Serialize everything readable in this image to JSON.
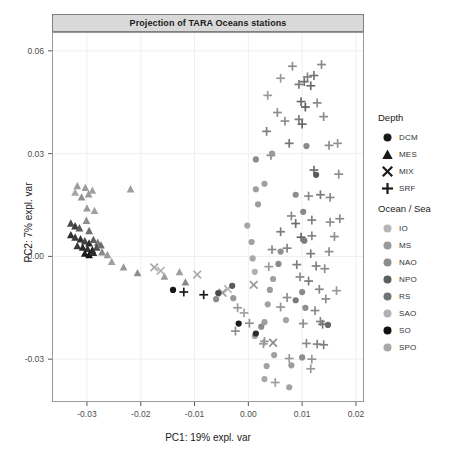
{
  "chart_data": {
    "type": "scatter",
    "title": "Projection of TARA Oceans stations",
    "xlabel": "PC1: 19% expl. var",
    "ylabel": "PC2: 7% expl. var",
    "xlim": [
      -0.0365,
      0.0215
    ],
    "ylim": [
      -0.0425,
      0.0655
    ],
    "xticks": [
      -0.03,
      -0.02,
      -0.01,
      0.0,
      0.01,
      0.02
    ],
    "xtick_labels": [
      "-0.03",
      "-0.02",
      "-0.01",
      "0.00",
      "0.01",
      "0.02"
    ],
    "yticks": [
      -0.03,
      0.0,
      0.03,
      0.06
    ],
    "ytick_labels": [
      "-0.03",
      "0.00",
      "0.03",
      "0.06"
    ],
    "grid": true,
    "grid_color": "#efefef",
    "panel_title_bg": "#d9d9d9",
    "legends": [
      {
        "title": "Depth",
        "name": "depth",
        "entries": [
          {
            "label": "DCM",
            "shape": "circle"
          },
          {
            "label": "MES",
            "shape": "triangle"
          },
          {
            "label": "MIX",
            "shape": "cross-x"
          },
          {
            "label": "SRF",
            "shape": "plus"
          }
        ]
      },
      {
        "title": "Ocean / Sea",
        "name": "ocean-sea",
        "entries": [
          {
            "label": "IO",
            "color": "#b6b6b6"
          },
          {
            "label": "MS",
            "color": "#9a9a9a"
          },
          {
            "label": "NAO",
            "color": "#8d8d8d"
          },
          {
            "label": "NPO",
            "color": "#5e5e5e"
          },
          {
            "label": "RS",
            "color": "#737373"
          },
          {
            "label": "SAO",
            "color": "#b0b0b0"
          },
          {
            "label": "SO",
            "color": "#111111"
          },
          {
            "label": "SPO",
            "color": "#a8a8a8"
          }
        ]
      }
    ],
    "points": [
      {
        "x": -0.0318,
        "y": 0.0205,
        "shape": "triangle",
        "color": "#9c9c9c"
      },
      {
        "x": -0.0303,
        "y": 0.02,
        "shape": "triangle",
        "color": "#9c9c9c"
      },
      {
        "x": -0.029,
        "y": 0.0192,
        "shape": "triangle",
        "color": "#a2a2a2"
      },
      {
        "x": -0.0322,
        "y": 0.0186,
        "shape": "triangle",
        "color": "#a5a5a5"
      },
      {
        "x": -0.0297,
        "y": 0.0181,
        "shape": "triangle",
        "color": "#9a9a9a"
      },
      {
        "x": -0.031,
        "y": 0.0172,
        "shape": "triangle",
        "color": "#8f8f8f"
      },
      {
        "x": -0.0219,
        "y": 0.0196,
        "shape": "triangle",
        "color": "#9f9f9f"
      },
      {
        "x": -0.03,
        "y": 0.014,
        "shape": "triangle",
        "color": "#9a9a9a"
      },
      {
        "x": -0.0286,
        "y": 0.0133,
        "shape": "triangle",
        "color": "#a0a0a0"
      },
      {
        "x": -0.033,
        "y": 0.0096,
        "shape": "triangle",
        "color": "#4a4a4a"
      },
      {
        "x": -0.0322,
        "y": 0.0088,
        "shape": "triangle",
        "color": "#3c3c3c"
      },
      {
        "x": -0.0314,
        "y": 0.0082,
        "shape": "triangle",
        "color": "#565656"
      },
      {
        "x": -0.0301,
        "y": 0.0104,
        "shape": "triangle",
        "color": "#8e8e8e"
      },
      {
        "x": -0.0296,
        "y": 0.0074,
        "shape": "triangle",
        "color": "#6c6c6c"
      },
      {
        "x": -0.033,
        "y": 0.0062,
        "shape": "triangle",
        "color": "#2f2f2f"
      },
      {
        "x": -0.0322,
        "y": 0.0055,
        "shape": "triangle",
        "color": "#3a3a3a"
      },
      {
        "x": -0.0312,
        "y": 0.005,
        "shape": "triangle",
        "color": "#303030"
      },
      {
        "x": -0.0304,
        "y": 0.0044,
        "shape": "triangle",
        "color": "#444444"
      },
      {
        "x": -0.0296,
        "y": 0.0038,
        "shape": "triangle",
        "color": "#2b2b2b"
      },
      {
        "x": -0.0288,
        "y": 0.0048,
        "shape": "triangle",
        "color": "#5f5f5f"
      },
      {
        "x": -0.028,
        "y": 0.004,
        "shape": "triangle",
        "color": "#7a7a7a"
      },
      {
        "x": -0.0318,
        "y": 0.003,
        "shape": "triangle",
        "color": "#383838"
      },
      {
        "x": -0.0308,
        "y": 0.0026,
        "shape": "triangle",
        "color": "#2a2a2a"
      },
      {
        "x": -0.0299,
        "y": 0.0022,
        "shape": "triangle",
        "color": "#333333"
      },
      {
        "x": -0.029,
        "y": 0.0018,
        "shape": "triangle",
        "color": "#202020"
      },
      {
        "x": -0.0282,
        "y": 0.0026,
        "shape": "triangle",
        "color": "#4e4e4e"
      },
      {
        "x": -0.0274,
        "y": 0.0032,
        "shape": "triangle",
        "color": "#6e6e6e"
      },
      {
        "x": -0.0304,
        "y": 0.0008,
        "shape": "triangle",
        "color": "#1a1a1a"
      },
      {
        "x": -0.0296,
        "y": 0.0004,
        "shape": "triangle",
        "color": "#151515"
      },
      {
        "x": -0.0288,
        "y": 0.001,
        "shape": "triangle",
        "color": "#2e2e2e"
      },
      {
        "x": -0.0272,
        "y": 0.0012,
        "shape": "triangle",
        "color": "#8a8a8a"
      },
      {
        "x": -0.0262,
        "y": 0.0004,
        "shape": "triangle",
        "color": "#9c9c9c"
      },
      {
        "x": -0.0254,
        "y": -0.0016,
        "shape": "triangle",
        "color": "#a0a0a0"
      },
      {
        "x": -0.0232,
        "y": -0.0032,
        "shape": "triangle",
        "color": "#9a9a9a"
      },
      {
        "x": -0.0206,
        "y": -0.0049,
        "shape": "triangle",
        "color": "#8e8e8e"
      },
      {
        "x": -0.0156,
        "y": -0.0059,
        "shape": "triangle",
        "color": "#9b9b9b"
      },
      {
        "x": -0.0128,
        "y": -0.0046,
        "shape": "triangle",
        "color": "#a0a0a0"
      },
      {
        "x": -0.0117,
        "y": -0.0076,
        "shape": "triangle",
        "color": "#888888"
      },
      {
        "x": -0.0175,
        "y": -0.0032,
        "shape": "cross-x",
        "color": "#aaaaaa"
      },
      {
        "x": -0.0163,
        "y": -0.0042,
        "shape": "cross-x",
        "color": "#b0b0b0"
      },
      {
        "x": -0.0095,
        "y": -0.0053,
        "shape": "cross-x",
        "color": "#aaaaaa"
      },
      {
        "x": -0.0048,
        "y": -0.0106,
        "shape": "cross-x",
        "color": "#9a9a9a"
      },
      {
        "x": -0.0038,
        "y": -0.0095,
        "shape": "cross-x",
        "color": "#b4b4b4"
      },
      {
        "x": 0.001,
        "y": -0.0083,
        "shape": "cross-x",
        "color": "#9c9c9c"
      },
      {
        "x": -0.014,
        "y": -0.0098,
        "shape": "circle",
        "color": "#151515"
      },
      {
        "x": -0.012,
        "y": -0.0104,
        "shape": "plus",
        "color": "#1a1a1a"
      },
      {
        "x": -0.0083,
        "y": -0.0112,
        "shape": "plus",
        "color": "#1d1d1d"
      },
      {
        "x": -0.0056,
        "y": -0.0107,
        "shape": "circle",
        "color": "#4a4a4a"
      },
      {
        "x": -0.006,
        "y": -0.0125,
        "shape": "circle",
        "color": "#8c8c8c"
      },
      {
        "x": -0.003,
        "y": -0.0086,
        "shape": "circle",
        "color": "#5a5a5a"
      },
      {
        "x": -0.0028,
        "y": -0.0122,
        "shape": "circle",
        "color": "#9a9a9a"
      },
      {
        "x": -0.002,
        "y": -0.015,
        "shape": "plus",
        "color": "#999999"
      },
      {
        "x": -0.0008,
        "y": -0.0165,
        "shape": "plus",
        "color": "#a2a2a2"
      },
      {
        "x": 0.0002,
        "y": -0.0195,
        "shape": "plus",
        "color": "#8f8f8f"
      },
      {
        "x": 0.0024,
        "y": -0.0205,
        "shape": "circle",
        "color": "#8a8a8a"
      },
      {
        "x": 0.0012,
        "y": -0.0232,
        "shape": "circle",
        "color": "#a4a4a4"
      },
      {
        "x": 0.0028,
        "y": -0.0255,
        "shape": "plus",
        "color": "#999999"
      },
      {
        "x": 0.0048,
        "y": -0.0288,
        "shape": "circle",
        "color": "#a0a0a0"
      },
      {
        "x": 0.0076,
        "y": -0.0298,
        "shape": "plus",
        "color": "#9a9a9a"
      },
      {
        "x": 0.01,
        "y": -0.0295,
        "shape": "circle",
        "color": "#8e8e8e"
      },
      {
        "x": 0.0118,
        "y": -0.03,
        "shape": "plus",
        "color": "#959595"
      },
      {
        "x": -0.0002,
        "y": 0.009,
        "shape": "circle",
        "color": "#a6a6a6"
      },
      {
        "x": 0.0018,
        "y": 0.0152,
        "shape": "circle",
        "color": "#9c9c9c"
      },
      {
        "x": 0.0006,
        "y": 0.0042,
        "shape": "circle",
        "color": "#a2a2a2"
      },
      {
        "x": 0.0008,
        "y": -0.0006,
        "shape": "circle",
        "color": "#a8a8a8"
      },
      {
        "x": 0.0012,
        "y": -0.0045,
        "shape": "circle",
        "color": "#b0b0b0"
      },
      {
        "x": 0.0014,
        "y": 0.0283,
        "shape": "circle",
        "color": "#8c8c8c"
      },
      {
        "x": 0.0034,
        "y": 0.0365,
        "shape": "plus",
        "color": "#7f7f7f"
      },
      {
        "x": 0.0042,
        "y": 0.0295,
        "shape": "plus",
        "color": "#8a8a8a"
      },
      {
        "x": 0.006,
        "y": 0.052,
        "shape": "plus",
        "color": "#9a9a9a"
      },
      {
        "x": 0.0082,
        "y": 0.0555,
        "shape": "plus",
        "color": "#8e8e8e"
      },
      {
        "x": 0.0094,
        "y": 0.0502,
        "shape": "plus",
        "color": "#7a7a7a"
      },
      {
        "x": 0.0104,
        "y": 0.051,
        "shape": "plus",
        "color": "#6f6f6f"
      },
      {
        "x": 0.011,
        "y": 0.0524,
        "shape": "plus",
        "color": "#828282"
      },
      {
        "x": 0.0116,
        "y": 0.0498,
        "shape": "plus",
        "color": "#6a6a6a"
      },
      {
        "x": 0.0122,
        "y": 0.0528,
        "shape": "plus",
        "color": "#757575"
      },
      {
        "x": 0.0098,
        "y": 0.0452,
        "shape": "plus",
        "color": "#6c6c6c"
      },
      {
        "x": 0.0106,
        "y": 0.0436,
        "shape": "plus",
        "color": "#5e5e5e"
      },
      {
        "x": 0.0128,
        "y": 0.0448,
        "shape": "plus",
        "color": "#8a8a8a"
      },
      {
        "x": 0.0094,
        "y": 0.04,
        "shape": "plus",
        "color": "#7c7c7c"
      },
      {
        "x": 0.01,
        "y": 0.0386,
        "shape": "plus",
        "color": "#686868"
      },
      {
        "x": 0.014,
        "y": 0.0408,
        "shape": "plus",
        "color": "#8e8e8e"
      },
      {
        "x": 0.0068,
        "y": 0.0395,
        "shape": "plus",
        "color": "#8f8f8f"
      },
      {
        "x": 0.0076,
        "y": 0.033,
        "shape": "plus",
        "color": "#747474"
      },
      {
        "x": 0.0108,
        "y": 0.0322,
        "shape": "circle",
        "color": "#8a8a8a"
      },
      {
        "x": 0.015,
        "y": 0.0324,
        "shape": "plus",
        "color": "#8c8c8c"
      },
      {
        "x": 0.0014,
        "y": 0.0196,
        "shape": "circle",
        "color": "#9e9e9e"
      },
      {
        "x": 0.0122,
        "y": 0.0252,
        "shape": "plus",
        "color": "#6e6e6e"
      },
      {
        "x": 0.0126,
        "y": 0.0238,
        "shape": "circle",
        "color": "#5a5a5a"
      },
      {
        "x": 0.0088,
        "y": 0.018,
        "shape": "circle",
        "color": "#8e8e8e"
      },
      {
        "x": 0.0112,
        "y": 0.0176,
        "shape": "plus",
        "color": "#8a8a8a"
      },
      {
        "x": 0.0134,
        "y": 0.018,
        "shape": "plus",
        "color": "#7a7a7a"
      },
      {
        "x": 0.0152,
        "y": 0.0172,
        "shape": "plus",
        "color": "#8c8c8c"
      },
      {
        "x": 0.008,
        "y": 0.0118,
        "shape": "plus",
        "color": "#8a8a8a"
      },
      {
        "x": 0.0088,
        "y": 0.0096,
        "shape": "plus",
        "color": "#6e6e6e"
      },
      {
        "x": 0.0102,
        "y": 0.013,
        "shape": "circle",
        "color": "#888888"
      },
      {
        "x": 0.0118,
        "y": 0.0106,
        "shape": "plus",
        "color": "#7f7f7f"
      },
      {
        "x": 0.0152,
        "y": 0.01,
        "shape": "plus",
        "color": "#909090"
      },
      {
        "x": 0.017,
        "y": 0.011,
        "shape": "plus",
        "color": "#8a8a8a"
      },
      {
        "x": 0.006,
        "y": 0.0072,
        "shape": "plus",
        "color": "#7a7a7a"
      },
      {
        "x": 0.0098,
        "y": 0.0056,
        "shape": "plus",
        "color": "#666666"
      },
      {
        "x": 0.0104,
        "y": 0.0046,
        "shape": "circle",
        "color": "#7c7c7c"
      },
      {
        "x": 0.0118,
        "y": 0.006,
        "shape": "plus",
        "color": "#858585"
      },
      {
        "x": 0.016,
        "y": 0.0058,
        "shape": "plus",
        "color": "#8e8e8e"
      },
      {
        "x": 0.0044,
        "y": 0.002,
        "shape": "plus",
        "color": "#8a8a8a"
      },
      {
        "x": 0.006,
        "y": 0.0014,
        "shape": "circle",
        "color": "#909090"
      },
      {
        "x": 0.0072,
        "y": 0.0024,
        "shape": "plus",
        "color": "#828282"
      },
      {
        "x": 0.0116,
        "y": 0.0008,
        "shape": "plus",
        "color": "#7e7e7e"
      },
      {
        "x": 0.015,
        "y": 0.0014,
        "shape": "plus",
        "color": "#8c8c8c"
      },
      {
        "x": 0.0038,
        "y": -0.003,
        "shape": "plus",
        "color": "#9a9a9a"
      },
      {
        "x": 0.0056,
        "y": -0.0022,
        "shape": "circle",
        "color": "#8a8a8a"
      },
      {
        "x": 0.009,
        "y": -0.0024,
        "shape": "plus",
        "color": "#7c7c7c"
      },
      {
        "x": 0.0126,
        "y": -0.0028,
        "shape": "plus",
        "color": "#838383"
      },
      {
        "x": 0.0142,
        "y": -0.0036,
        "shape": "plus",
        "color": "#8e8e8e"
      },
      {
        "x": 0.0046,
        "y": -0.0066,
        "shape": "circle",
        "color": "#a0a0a0"
      },
      {
        "x": 0.0096,
        "y": -0.006,
        "shape": "plus",
        "color": "#8a8a8a"
      },
      {
        "x": 0.0112,
        "y": -0.0072,
        "shape": "plus",
        "color": "#7a7a7a"
      },
      {
        "x": 0.004,
        "y": -0.0098,
        "shape": "circle",
        "color": "#9c9c9c"
      },
      {
        "x": 0.01,
        "y": -0.0104,
        "shape": "circle",
        "color": "#888888"
      },
      {
        "x": 0.0132,
        "y": -0.0096,
        "shape": "plus",
        "color": "#868686"
      },
      {
        "x": 0.0036,
        "y": -0.014,
        "shape": "circle",
        "color": "#a2a2a2"
      },
      {
        "x": 0.006,
        "y": -0.0148,
        "shape": "plus",
        "color": "#949494"
      },
      {
        "x": 0.0106,
        "y": -0.015,
        "shape": "circle",
        "color": "#8e8e8e"
      },
      {
        "x": 0.0124,
        "y": -0.0158,
        "shape": "plus",
        "color": "#8a8a8a"
      },
      {
        "x": 0.003,
        "y": -0.0192,
        "shape": "circle",
        "color": "#9e9e9e"
      },
      {
        "x": 0.007,
        "y": -0.0186,
        "shape": "circle",
        "color": "#a4a4a4"
      },
      {
        "x": 0.0102,
        "y": -0.0196,
        "shape": "plus",
        "color": "#8c8c8c"
      },
      {
        "x": 0.0134,
        "y": -0.019,
        "shape": "plus",
        "color": "#828282"
      },
      {
        "x": 0.0138,
        "y": -0.0198,
        "shape": "plus",
        "color": "#767676"
      },
      {
        "x": 0.0148,
        "y": -0.02,
        "shape": "circle",
        "color": "#6a6a6a"
      },
      {
        "x": 0.003,
        "y": -0.0248,
        "shape": "plus",
        "color": "#999999"
      },
      {
        "x": 0.0046,
        "y": -0.0252,
        "shape": "cross-x",
        "color": "#8e8e8e"
      },
      {
        "x": 0.0108,
        "y": -0.0254,
        "shape": "plus",
        "color": "#8a8a8a"
      },
      {
        "x": 0.0128,
        "y": -0.0256,
        "shape": "plus",
        "color": "#858585"
      },
      {
        "x": 0.014,
        "y": -0.0258,
        "shape": "plus",
        "color": "#7c7c7c"
      },
      {
        "x": 0.0014,
        "y": -0.0225,
        "shape": "circle",
        "color": "#2b2b2b"
      },
      {
        "x": -0.0018,
        "y": -0.0196,
        "shape": "circle",
        "color": "#1c1c1c"
      },
      {
        "x": -0.0024,
        "y": -0.0218,
        "shape": "plus",
        "color": "#8e8e8e"
      },
      {
        "x": 0.0034,
        "y": -0.032,
        "shape": "circle",
        "color": "#a4a4a4"
      },
      {
        "x": 0.008,
        "y": -0.0318,
        "shape": "circle",
        "color": "#9c9c9c"
      },
      {
        "x": 0.0116,
        "y": -0.0328,
        "shape": "plus",
        "color": "#9a9a9a"
      },
      {
        "x": 0.003,
        "y": -0.0358,
        "shape": "circle",
        "color": "#a8a8a8"
      },
      {
        "x": 0.005,
        "y": -0.0368,
        "shape": "plus",
        "color": "#9e9e9e"
      },
      {
        "x": 0.0076,
        "y": -0.0382,
        "shape": "circle",
        "color": "#a2a2a2"
      },
      {
        "x": 0.0164,
        "y": -0.01,
        "shape": "plus",
        "color": "#9a9a9a"
      },
      {
        "x": 0.0168,
        "y": 0.024,
        "shape": "plus",
        "color": "#8c8c8c"
      },
      {
        "x": 0.0166,
        "y": 0.033,
        "shape": "plus",
        "color": "#949494"
      },
      {
        "x": 0.0036,
        "y": 0.047,
        "shape": "plus",
        "color": "#9a9a9a"
      },
      {
        "x": 0.0054,
        "y": 0.042,
        "shape": "plus",
        "color": "#8e8e8e"
      },
      {
        "x": 0.0044,
        "y": 0.03,
        "shape": "circle",
        "color": "#9a9a9a"
      },
      {
        "x": 0.003,
        "y": 0.0212,
        "shape": "circle",
        "color": "#a0a0a0"
      },
      {
        "x": 0.0136,
        "y": 0.056,
        "shape": "plus",
        "color": "#8a8a8a"
      },
      {
        "x": 0.0072,
        "y": -0.012,
        "shape": "plus",
        "color": "#8e8e8e"
      },
      {
        "x": 0.0088,
        "y": -0.0128,
        "shape": "circle",
        "color": "#7a7a7a"
      },
      {
        "x": 0.0144,
        "y": -0.0124,
        "shape": "plus",
        "color": "#8c8c8c"
      }
    ]
  }
}
